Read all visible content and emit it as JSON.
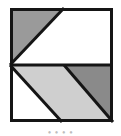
{
  "figure": {
    "frame": {
      "x": 10,
      "y": 8,
      "width": 103,
      "height": 114,
      "stroke_color": "#151515",
      "stroke_width": 3,
      "fill_color": "#ffffff"
    },
    "divider": {
      "name": "horizontal-midline",
      "y": 65,
      "stroke_color": "#151515",
      "stroke_width": 3
    },
    "colors": {
      "ink": "#151515",
      "paper": "#ffffff",
      "gray_medium": "#9a9a9a",
      "gray_light": "#cfcfcf",
      "gray_dark": "#8a8a8a"
    },
    "regions": [
      {
        "id": "top-left-triangle",
        "band": "upper",
        "shape": "triangle",
        "fill": "#9a9a9a",
        "points": "10,8 64,8 10,65"
      },
      {
        "id": "top-right-triangle",
        "band": "upper",
        "shape": "triangle",
        "fill": "#ffffff",
        "points": "64,8 113,8 113,65 10,65"
      },
      {
        "id": "bottom-left-triangle",
        "band": "lower",
        "shape": "triangle",
        "fill": "#ffffff",
        "points": "10,65 10,122 62,122"
      },
      {
        "id": "bottom-middle-parallelogram",
        "band": "lower",
        "shape": "parallelogram",
        "fill": "#cfcfcf",
        "points": "10,65 64,65 113,122 62,122"
      },
      {
        "id": "bottom-right-triangle",
        "band": "lower",
        "shape": "triangle",
        "fill": "#8a8a8a",
        "points": "64,65 113,65 113,122"
      }
    ],
    "diagonals": [
      {
        "id": "upper-diagonal",
        "from": "10,65",
        "to": "64,8"
      },
      {
        "id": "lower-left-diagonal",
        "from": "10,65",
        "to": "62,122"
      },
      {
        "id": "lower-right-diagonal",
        "from": "64,65",
        "to": "113,122"
      }
    ]
  },
  "caption": {
    "text": "•   •    •      •",
    "note": "clipped text row"
  }
}
